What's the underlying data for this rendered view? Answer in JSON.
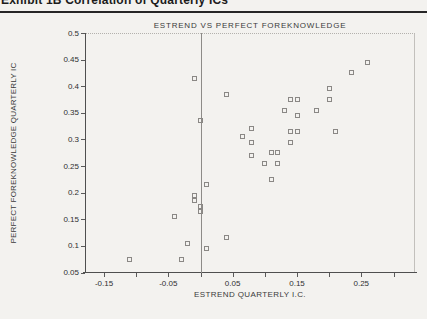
{
  "page": {
    "header_fragment": "Exhibit 1B   Correlation of Quarterly ICs"
  },
  "chart_data": {
    "type": "scatter",
    "title": "ESTREND VS PERFECT FOREKNOWLEDGE",
    "xlabel": "ESTREND QUARTERLY I.C.",
    "ylabel": "PERFECT FOREKNOWLEDGE QUARTERLY IC",
    "xlim": [
      -0.1795,
      0.3335
    ],
    "ylim": [
      0.05,
      0.5
    ],
    "grid": false,
    "legend": "none",
    "marker": "open-square",
    "marker_color": "#8a8885",
    "axis_color": "#4f4f4f",
    "zero_line_x": 0,
    "x_minor_tick_values": [
      -0.15,
      -0.1,
      -0.05,
      0.0,
      0.05,
      0.1,
      0.15,
      0.2,
      0.25,
      0.3
    ],
    "x_tick_values": [
      -0.15,
      -0.05,
      0.05,
      0.15,
      0.25
    ],
    "x_tick_labels": [
      "-0.15",
      "-0.05",
      "0.05",
      "0.15",
      "0.25"
    ],
    "y_tick_values": [
      0.05,
      0.1,
      0.15,
      0.2,
      0.25,
      0.3,
      0.35,
      0.4,
      0.45,
      0.5
    ],
    "y_tick_labels": [
      "0.05",
      "0.1",
      "0.15",
      "0.2",
      "0.25",
      "0.3",
      "0.35",
      "0.4",
      "0.45",
      "0.5"
    ],
    "points": [
      [
        -0.01,
        0.415
      ],
      [
        0.04,
        0.385
      ],
      [
        0.0,
        0.335
      ],
      [
        0.26,
        0.445
      ],
      [
        0.235,
        0.425
      ],
      [
        0.2,
        0.395
      ],
      [
        0.2,
        0.375
      ],
      [
        0.14,
        0.375
      ],
      [
        0.15,
        0.375
      ],
      [
        0.13,
        0.355
      ],
      [
        0.18,
        0.355
      ],
      [
        0.15,
        0.345
      ],
      [
        0.14,
        0.315
      ],
      [
        0.15,
        0.315
      ],
      [
        0.21,
        0.315
      ],
      [
        0.08,
        0.32
      ],
      [
        0.065,
        0.305
      ],
      [
        0.08,
        0.295
      ],
      [
        0.14,
        0.295
      ],
      [
        0.08,
        0.27
      ],
      [
        0.11,
        0.275
      ],
      [
        0.12,
        0.275
      ],
      [
        0.1,
        0.255
      ],
      [
        0.12,
        0.255
      ],
      [
        0.11,
        0.225
      ],
      [
        0.01,
        0.215
      ],
      [
        -0.01,
        0.195
      ],
      [
        -0.01,
        0.185
      ],
      [
        0.0,
        0.175
      ],
      [
        0.0,
        0.165
      ],
      [
        -0.04,
        0.155
      ],
      [
        0.04,
        0.115
      ],
      [
        -0.02,
        0.105
      ],
      [
        0.01,
        0.095
      ],
      [
        -0.11,
        0.075
      ],
      [
        -0.03,
        0.075
      ]
    ]
  }
}
